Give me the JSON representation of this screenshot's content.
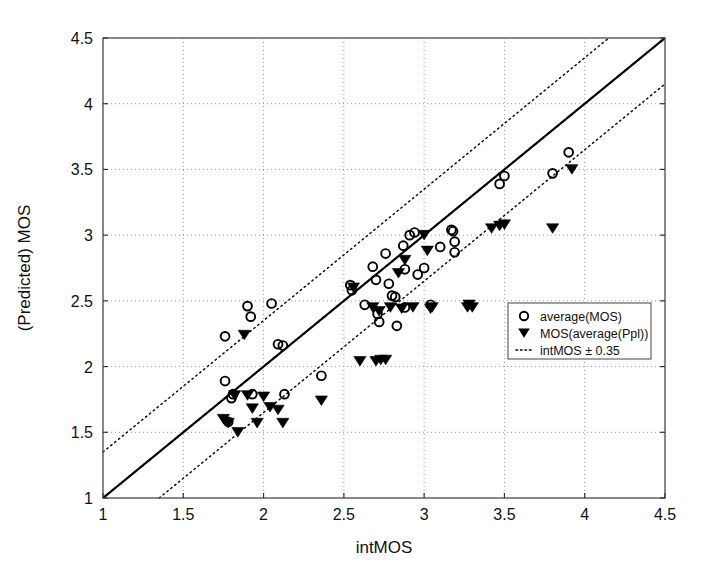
{
  "chart_data": {
    "type": "scatter",
    "title": "",
    "xlabel": "intMOS",
    "ylabel": "(Predicted) MOS",
    "xlim": [
      1,
      4.5
    ],
    "ylim": [
      1,
      4.5
    ],
    "xticks": [
      1,
      1.5,
      2,
      2.5,
      3,
      3.5,
      4,
      4.5
    ],
    "yticks": [
      1,
      1.5,
      2,
      2.5,
      3,
      3.5,
      4,
      4.5
    ],
    "xtick_labels": [
      "1",
      "1.5",
      "2",
      "2.5",
      "3",
      "3.5",
      "4",
      "4.5"
    ],
    "ytick_labels": [
      "1",
      "1.5",
      "2",
      "2.5",
      "3",
      "3.5",
      "4",
      "4.5"
    ],
    "grid": true,
    "grid_style": "dotted",
    "legend_position": "center-right",
    "legend_entries": [
      {
        "label": "average(MOS)",
        "marker": "circle-open",
        "color": "#000000"
      },
      {
        "label": "MOS(average(Ppl))",
        "marker": "triangle-down-filled",
        "color": "#000000"
      },
      {
        "label": "intMOS ± 0.35",
        "marker": "dotted-line",
        "color": "#000000"
      }
    ],
    "reference_lines": [
      {
        "name": "identity",
        "style": "solid",
        "slope": 1,
        "intercept": 0,
        "color": "#000000"
      },
      {
        "name": "upper-tolerance",
        "style": "dotted",
        "slope": 1,
        "intercept": 0.35,
        "color": "#000000"
      },
      {
        "name": "lower-tolerance",
        "style": "dotted",
        "slope": 1,
        "intercept": -0.35,
        "color": "#000000"
      }
    ],
    "series": [
      {
        "name": "average(MOS)",
        "marker": "circle-open",
        "points": [
          [
            1.76,
            2.23
          ],
          [
            1.76,
            1.89
          ],
          [
            1.78,
            1.58
          ],
          [
            1.8,
            1.76
          ],
          [
            1.81,
            1.79
          ],
          [
            1.9,
            2.46
          ],
          [
            1.92,
            2.38
          ],
          [
            1.93,
            1.79
          ],
          [
            2.05,
            2.48
          ],
          [
            2.09,
            2.17
          ],
          [
            2.12,
            2.16
          ],
          [
            2.13,
            1.79
          ],
          [
            2.36,
            1.93
          ],
          [
            2.54,
            2.62
          ],
          [
            2.55,
            2.58
          ],
          [
            2.63,
            2.47
          ],
          [
            2.68,
            2.76
          ],
          [
            2.7,
            2.66
          ],
          [
            2.71,
            2.4
          ],
          [
            2.72,
            2.34
          ],
          [
            2.76,
            2.86
          ],
          [
            2.78,
            2.63
          ],
          [
            2.8,
            2.54
          ],
          [
            2.82,
            2.53
          ],
          [
            2.83,
            2.31
          ],
          [
            2.87,
            2.92
          ],
          [
            2.88,
            2.74
          ],
          [
            2.88,
            2.45
          ],
          [
            2.91,
            3.0
          ],
          [
            2.94,
            3.02
          ],
          [
            2.96,
            2.7
          ],
          [
            3.0,
            2.75
          ],
          [
            3.04,
            2.47
          ],
          [
            3.1,
            2.91
          ],
          [
            3.17,
            3.04
          ],
          [
            3.18,
            3.03
          ],
          [
            3.19,
            2.95
          ],
          [
            3.19,
            2.87
          ],
          [
            3.47,
            3.39
          ],
          [
            3.5,
            3.45
          ],
          [
            3.8,
            3.47
          ],
          [
            3.9,
            3.63
          ]
        ]
      },
      {
        "name": "MOS(average(Ppl))",
        "marker": "triangle-down-filled",
        "points": [
          [
            1.75,
            1.6
          ],
          [
            1.78,
            1.57
          ],
          [
            1.82,
            1.78
          ],
          [
            1.84,
            1.5
          ],
          [
            1.88,
            2.24
          ],
          [
            1.9,
            1.78
          ],
          [
            1.93,
            1.68
          ],
          [
            1.96,
            1.57
          ],
          [
            2.0,
            1.77
          ],
          [
            2.04,
            1.69
          ],
          [
            2.09,
            1.67
          ],
          [
            2.12,
            1.57
          ],
          [
            2.36,
            1.74
          ],
          [
            2.56,
            2.6
          ],
          [
            2.6,
            2.04
          ],
          [
            2.68,
            2.45
          ],
          [
            2.7,
            2.04
          ],
          [
            2.72,
            2.42
          ],
          [
            2.73,
            2.05
          ],
          [
            2.76,
            2.05
          ],
          [
            2.79,
            2.45
          ],
          [
            2.84,
            2.71
          ],
          [
            2.86,
            2.44
          ],
          [
            2.88,
            2.81
          ],
          [
            2.93,
            2.45
          ],
          [
            3.0,
            3.0
          ],
          [
            3.02,
            2.88
          ],
          [
            3.04,
            2.44
          ],
          [
            3.05,
            2.45
          ],
          [
            3.27,
            2.45
          ],
          [
            3.28,
            2.47
          ],
          [
            3.3,
            2.45
          ],
          [
            3.42,
            3.05
          ],
          [
            3.47,
            3.07
          ],
          [
            3.5,
            3.08
          ],
          [
            3.8,
            3.05
          ],
          [
            3.92,
            3.5
          ]
        ]
      }
    ]
  },
  "axes": {
    "x_axis_label": "intMOS",
    "y_axis_label": "(Predicted) MOS"
  }
}
